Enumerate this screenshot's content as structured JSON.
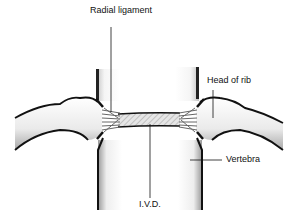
{
  "diagram": {
    "labels": {
      "radial_ligament": "Radial ligament",
      "head_of_rib": "Head of rib",
      "vertebra": "Vertebra",
      "ivd": "I.V.D."
    },
    "colors": {
      "outline": "#111111",
      "bone_fill": "#f4f4f4",
      "shadow": "#b8b8b8",
      "ligament": "#777777",
      "disc_hatch": "#9a9a9a"
    }
  }
}
